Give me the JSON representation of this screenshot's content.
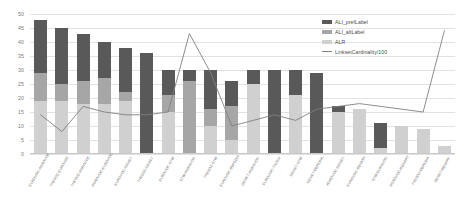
{
  "chart_data": {
    "type": "bar",
    "title": "",
    "subtitle": "",
    "xlabel": "",
    "ylabel": "",
    "ylim": [
      0,
      50
    ],
    "ytick_values": [
      0,
      5,
      10,
      15,
      20,
      25,
      30,
      35,
      40,
      45,
      50
    ],
    "grid": true,
    "stacked": true,
    "legend_position": "top-right",
    "legend": [
      {
        "label": "ALI_prefLabel",
        "color": "#595959",
        "marker": "bar"
      },
      {
        "label": "ALI_altLabel",
        "color": "#a6a6a6",
        "marker": "bar"
      },
      {
        "label": "ALR",
        "color": "#d0d0d0",
        "marker": "bar"
      },
      {
        "label": "LinksetCardinality/100",
        "color": "#808080",
        "marker": "line"
      }
    ],
    "categories": [
      "EUROVOC-AGROVOC",
      "THESOZ-EUROVOC",
      "THESOZ-AGROVOC",
      "AGROVOC-EUROVOC",
      "EUROVOC-GEMET",
      "THESOZ-GEMET",
      "EUROVOC-STW",
      "STW-AGROVOC",
      "THESOZ-STW",
      "EUROVOC-DBPEDIA",
      "GEMET-AGROVOC",
      "EUROVOC-TheSoz",
      "GEMET-STW",
      "GEMET-DBPEDIA",
      "AGROVOC-GEMET",
      "EUROVOC-DBNARY",
      "STW-EUROVOC",
      "AGROVOC-DBNARY",
      "THESOZ-DBPEDIA",
      "GEMET-DBNARY"
    ],
    "series": [
      {
        "name": "ALI_prefLabel",
        "color": "#595959",
        "values": [
          19,
          20,
          17,
          13,
          16,
          36,
          9,
          4,
          14,
          9,
          5,
          30,
          9,
          29,
          2,
          0,
          9,
          0,
          0,
          0
        ]
      },
      {
        "name": "ALI_altLabel",
        "color": "#a6a6a6",
        "values": [
          10,
          6,
          8,
          9,
          3,
          0,
          6,
          26,
          6,
          12,
          0,
          0,
          0,
          0,
          0,
          0,
          0,
          0,
          0,
          0
        ]
      },
      {
        "name": "ALR",
        "color": "#d0d0d0",
        "values": [
          19,
          19,
          18,
          18,
          19,
          0,
          15,
          0,
          10,
          5,
          25,
          0,
          21,
          0,
          15,
          16,
          2,
          10,
          9,
          3
        ]
      }
    ],
    "line_series": {
      "name": "LinksetCardinality/100",
      "color": "#808080",
      "values": [
        14,
        8,
        17,
        15,
        14,
        14,
        15,
        43,
        29,
        10,
        12,
        14,
        12,
        16,
        17,
        18,
        17,
        16,
        15,
        44
      ]
    },
    "totals": [
      48,
      45,
      43,
      40,
      38,
      36,
      30,
      30,
      30,
      26,
      25,
      30,
      21,
      29,
      17,
      16,
      11,
      10,
      9,
      3
    ]
  }
}
